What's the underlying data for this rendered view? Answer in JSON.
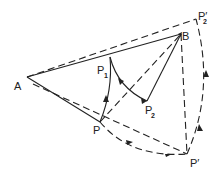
{
  "diagram": {
    "colors": {
      "stroke": "#222222",
      "background": "#ffffff"
    },
    "points": {
      "A": {
        "label": "A",
        "sub": "",
        "x": 27,
        "y": 77
      },
      "B": {
        "label": "B",
        "sub": "",
        "x": 181,
        "y": 34
      },
      "P2p": {
        "label": "P",
        "sub": "2",
        "prime": "′",
        "x": 196,
        "y": 19
      },
      "P1": {
        "label": "P",
        "sub": "1",
        "x": 110,
        "y": 57
      },
      "P2": {
        "label": "P",
        "sub": "2",
        "x": 147,
        "y": 101
      },
      "P": {
        "label": "P",
        "sub": "",
        "x": 100,
        "y": 122
      },
      "Pp": {
        "label": "P",
        "sub": "",
        "prime": "′",
        "x": 187,
        "y": 154
      }
    },
    "labels": {
      "A": "A",
      "B": "B",
      "P": "P",
      "P1": "P",
      "P1_sub": "1",
      "P2": "P",
      "P2_sub": "2",
      "Pp": "P′",
      "P2p": "P′",
      "P2p_sub": "2"
    },
    "solid_lines": [
      [
        "A",
        "B"
      ],
      [
        "A",
        "P"
      ],
      [
        "P1",
        "P2"
      ],
      [
        "P2",
        "B"
      ]
    ],
    "dashed_lines": [
      [
        "A",
        "P2p"
      ],
      [
        "A",
        "Pp"
      ],
      [
        "P",
        "B"
      ],
      [
        "B",
        "Pp"
      ]
    ],
    "arcs": [
      {
        "from": "P",
        "to": "P1",
        "style": "solid",
        "arrow": "toward P1"
      },
      {
        "from": "P1",
        "to": "P2",
        "style": "solid",
        "arrow": "toward P2"
      },
      {
        "from": "P",
        "to": "Pp",
        "style": "dashed",
        "arrow": "toward P'"
      },
      {
        "from": "Pp",
        "to": "P2p",
        "style": "dashed",
        "arrow": "toward P2'"
      }
    ]
  }
}
